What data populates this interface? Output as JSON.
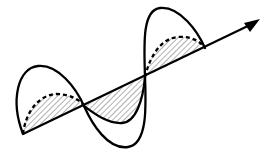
{
  "diagram": {
    "type": "electromagnetic-wave",
    "colors": {
      "stroke": "#000000",
      "background": "#ffffff",
      "hatch": "#555555"
    },
    "components": [
      {
        "name": "solid-wave",
        "style": "solid",
        "plane": "vertical"
      },
      {
        "name": "dashed-wave",
        "style": "dashed",
        "plane": "horizontal",
        "fill": "hatched"
      }
    ],
    "axis": {
      "direction": "arrow-right-up",
      "label": ""
    }
  }
}
